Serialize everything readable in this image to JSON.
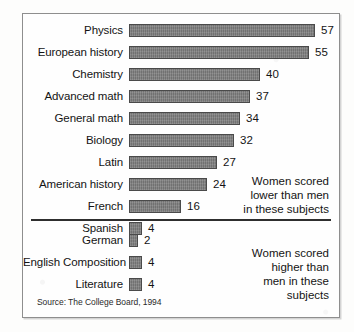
{
  "chart_data": {
    "type": "bar",
    "title": "",
    "orientation": "horizontal",
    "xlabel": "",
    "ylabel": "",
    "groups": [
      {
        "name": "women-scored-lower",
        "annotation_lines": [
          "Women scored",
          "lower than men",
          "in these subjects"
        ],
        "categories": [
          "Physics",
          "European history",
          "Chemistry",
          "Advanced math",
          "General math",
          "Biology",
          "Latin",
          "American history",
          "French",
          "Spanish"
        ],
        "values": [
          57,
          55,
          40,
          37,
          34,
          32,
          27,
          24,
          16,
          4
        ]
      },
      {
        "name": "women-scored-higher",
        "annotation_lines": [
          "Women scored",
          "higher than",
          "men in these",
          "subjects"
        ],
        "categories": [
          "German",
          "English Composition",
          "Literature"
        ],
        "values": [
          2,
          4,
          4
        ]
      }
    ],
    "source": "Source: The College Board, 1994",
    "bar_color": "#7c7c7c",
    "bar_border_color": "#4a4a4a",
    "text_color": "#141414",
    "scale_px_per_unit": 3.27,
    "min_bar_px": 9
  }
}
